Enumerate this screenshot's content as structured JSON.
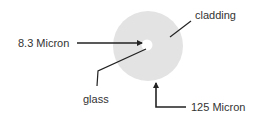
{
  "diagram": {
    "labels": {
      "cladding": "cladding",
      "core_size": "8.3 Micron",
      "core": "glass",
      "cladding_size": "125 Micron"
    },
    "colors": {
      "cladding_fill": "#e3e3e3",
      "core_fill": "#ffffff",
      "line": "#222222",
      "text": "#333333"
    }
  }
}
